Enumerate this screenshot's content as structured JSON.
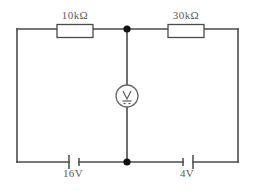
{
  "diagram": {
    "type": "electrical-circuit-schematic",
    "colors": {
      "background": "#ffffff",
      "wire": "#4a4a4a",
      "node": "#111111",
      "text": "#5b5b5b",
      "component_fill": "#ffffff"
    },
    "components": [
      {
        "id": "r1",
        "kind": "resistor",
        "label": "10kΩ",
        "value": "10",
        "unit": "kΩ",
        "position": "top-left-branch",
        "label_position": "above"
      },
      {
        "id": "r2",
        "kind": "resistor",
        "label": "30kΩ",
        "value": "30",
        "unit": "kΩ",
        "position": "top-right-branch",
        "label_position": "above"
      },
      {
        "id": "v1",
        "kind": "battery",
        "label": "16V",
        "value": "16",
        "unit": "V",
        "position": "bottom-left-branch",
        "label_position": "below"
      },
      {
        "id": "v2",
        "kind": "battery",
        "label": "4V",
        "value": "4",
        "unit": "V",
        "position": "bottom-right-branch",
        "label_position": "below"
      },
      {
        "id": "m1",
        "kind": "voltmeter",
        "label": "V",
        "symbol": "voltmeter-dc",
        "position": "center-vertical-branch",
        "label_position": "inside"
      }
    ],
    "nodes": [
      {
        "id": "node-top",
        "label": "",
        "position": "top-center"
      },
      {
        "id": "node-bottom",
        "label": "",
        "position": "bottom-center"
      }
    ],
    "meter": {
      "letter": "V",
      "dc_indicator": "---"
    }
  }
}
